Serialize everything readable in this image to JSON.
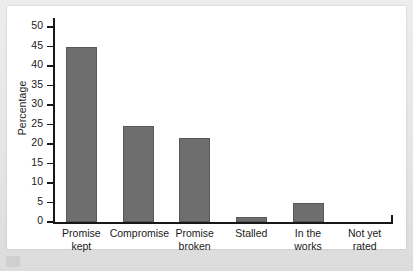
{
  "chart_data": {
    "type": "bar",
    "title": "",
    "subtitle": "",
    "xlabel": "",
    "ylabel": "Percentage",
    "ylim": [
      0,
      50
    ],
    "ytick_step": 5,
    "yticks": [
      0,
      5,
      10,
      15,
      20,
      25,
      30,
      35,
      40,
      45,
      50
    ],
    "ytick_labels": [
      "0",
      "5",
      "10",
      "15",
      "20",
      "25",
      "30",
      "35",
      "40",
      "45",
      "50"
    ],
    "grid": false,
    "legend": null,
    "legend_position": "none",
    "categories": [
      "Promise kept",
      "Compromise",
      "Promise broken",
      "Stalled",
      "In the works",
      "Not yet rated"
    ],
    "category_lines": [
      [
        "Promise",
        "kept"
      ],
      [
        "Compromise",
        ""
      ],
      [
        "Promise",
        "broken"
      ],
      [
        "Stalled",
        ""
      ],
      [
        "In the",
        "works"
      ],
      [
        "Not yet",
        "rated"
      ]
    ],
    "values": [
      45,
      24.7,
      21.5,
      1.2,
      5,
      0
    ],
    "bar_color": "#6e6e6e",
    "bar_edge_color": "#595959",
    "axis_color": "#171717",
    "plot_background": "#ffffff",
    "page_background": "#e9e9e9"
  }
}
